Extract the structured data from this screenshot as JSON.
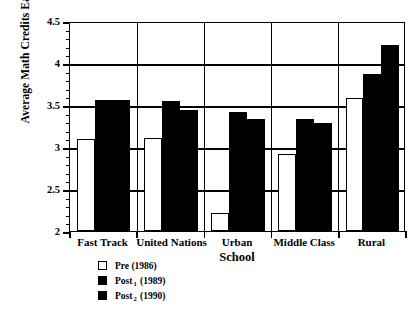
{
  "chart_data": {
    "type": "bar",
    "title": "",
    "xlabel": "School",
    "ylabel": "Average Math Credits Earned",
    "categories": [
      "Fast Track",
      "United Nations",
      "Urban",
      "Middle Class",
      "Rural"
    ],
    "series": [
      {
        "name": "Pre (1986)",
        "values": [
          3.1,
          3.11,
          2.22,
          2.92,
          3.58
        ],
        "color": "#ffffff"
      },
      {
        "name": "Post 1 (1989)",
        "values": [
          3.56,
          3.55,
          3.42,
          3.33,
          3.87
        ],
        "color": "#000000"
      },
      {
        "name": "Post 2 (1990)",
        "values": [
          3.56,
          3.44,
          3.33,
          3.28,
          4.22
        ],
        "color": "#000000"
      }
    ],
    "ylim": [
      2,
      4.5
    ],
    "ytick_labels": [
      "4.5",
      "4",
      "3.5",
      "3",
      "2.5",
      "2"
    ],
    "ytick_values": [
      4.5,
      4,
      3.5,
      3,
      2.5,
      2
    ],
    "yminor_step": 0.1,
    "grid": "horizontal-and-vertical",
    "legend_position": "below-axis-left"
  },
  "legend": {
    "entries": [
      {
        "label": "Pre (1986)",
        "sub": "",
        "tail": "",
        "swatch": "white"
      },
      {
        "label": "Post",
        "sub": "1",
        "tail": " (1989)",
        "swatch": "black"
      },
      {
        "label": "Post",
        "sub": "2",
        "tail": " (1990)",
        "swatch": "black"
      }
    ]
  },
  "axis": {
    "y_title": "Average Math Credits Earned",
    "x_title": "School"
  }
}
